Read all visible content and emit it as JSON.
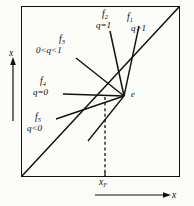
{
  "figure": {
    "kind": "ray-fan-diagram",
    "stroke_color": "#111111",
    "background_color": "#fbfbf8"
  },
  "axes": {
    "x_label": "x",
    "y_label": "x",
    "tick_label": "x",
    "tick_subscript": "F"
  },
  "point": {
    "label": "e"
  },
  "curves": [
    {
      "id": "f1",
      "name": "f",
      "subscript": "1",
      "condition": "q>1"
    },
    {
      "id": "f2",
      "name": "f",
      "subscript": "2",
      "condition": "q=1"
    },
    {
      "id": "f3",
      "name": "f",
      "subscript": "3",
      "condition": "0<q<1"
    },
    {
      "id": "f4",
      "name": "f",
      "subscript": "4",
      "condition": "q=0"
    },
    {
      "id": "f5",
      "name": "f",
      "subscript": "5",
      "condition": "q<0"
    }
  ]
}
